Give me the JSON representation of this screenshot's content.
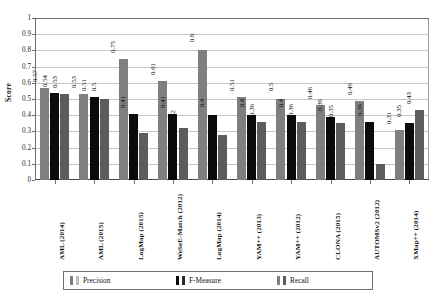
{
  "page": {
    "artifact_text": "..."
  },
  "chart_data": {
    "type": "bar",
    "title": "",
    "xlabel": "",
    "ylabel": "Score",
    "ylim": [
      0,
      1
    ],
    "ytick_step": 0.1,
    "grid": true,
    "legend_position": "bottom",
    "yticks": [
      "1",
      "0.9",
      "0.8",
      "0.7",
      "0.6",
      "0.5",
      "0.4",
      "0.3",
      "0.2",
      "0.1",
      "0"
    ],
    "categories": [
      "AML (2014)",
      "AML (2015)",
      "LogMap (2015)",
      "WeSeE-Match (2012)",
      "LogMap (2014)",
      "YAM++ (2013)",
      "YAM++ (2012)",
      "CLONA (2015)",
      "AUTOMSv2 (2012)",
      "XMap++ (2014)"
    ],
    "series": [
      {
        "name": "Precision",
        "color": "#7f7f7f",
        "values": [
          0.57,
          0.53,
          0.75,
          0.61,
          0.8,
          0.51,
          0.5,
          0.46,
          0.49,
          0.31
        ],
        "labels": [
          "0.57",
          "0.53",
          "0.75",
          "0.61",
          "0.8",
          "0.51",
          "0.5",
          "0.46",
          "0.49",
          "0.31"
        ]
      },
      {
        "name": "F-Measure",
        "color": "#0b0b0b",
        "values": [
          0.54,
          0.51,
          0.41,
          0.41,
          0.4,
          0.4,
          0.4,
          0.39,
          0.36,
          0.35
        ],
        "labels": [
          "0.54",
          "0.51",
          "0.41",
          "0.41",
          "0.4",
          "0.4",
          "0.4",
          "0.39",
          "0.36",
          "0.35"
        ]
      },
      {
        "name": "Recall",
        "color": "#5c5c5c",
        "values": [
          0.53,
          0.5,
          0.29,
          0.32,
          0.28,
          0.36,
          0.36,
          0.35,
          0.1,
          0.43
        ],
        "labels": [
          "0.53",
          "0.5",
          "0.29",
          "0.32",
          "0.28",
          "0.36",
          "0.36",
          "0.35",
          "0.1",
          "0.43"
        ]
      }
    ]
  },
  "legend": {
    "items": [
      {
        "label": "Precision"
      },
      {
        "label": "F-Measure"
      },
      {
        "label": "Recall"
      }
    ]
  }
}
